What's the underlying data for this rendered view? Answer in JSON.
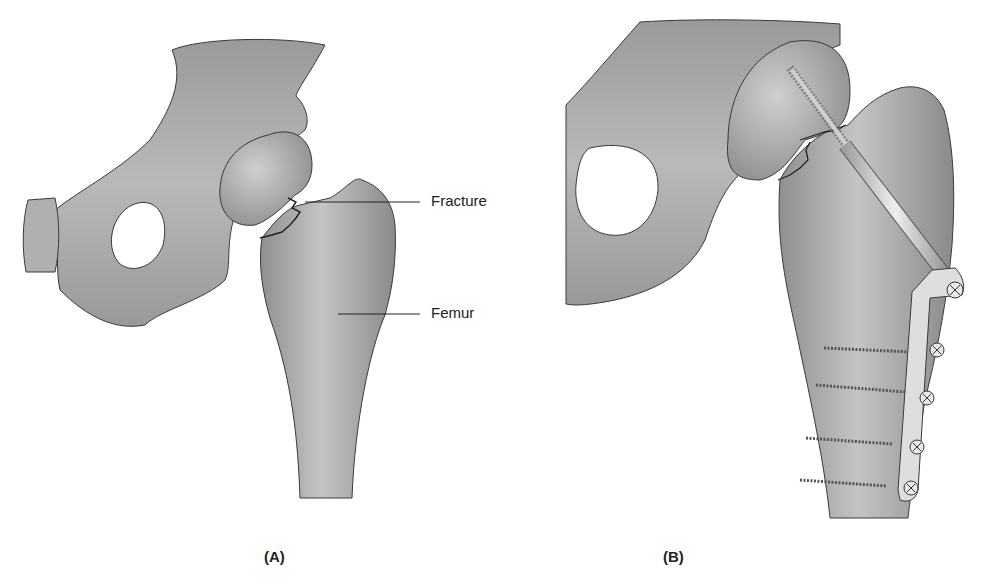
{
  "figure": {
    "panels": [
      {
        "id": "A",
        "label": "(A)",
        "description": "Hip joint with fracture of the femoral neck",
        "callouts": [
          {
            "text": "Fracture"
          },
          {
            "text": "Femur"
          }
        ]
      },
      {
        "id": "B",
        "label": "(B)",
        "description": "Fracture fixed with lag screw and side plate with screws",
        "hardware": {
          "lag_screw": 1,
          "side_plate": 1,
          "plate_screws": 4,
          "plate_screw_heads": 5
        }
      }
    ],
    "colors": {
      "bone_fill": "#a9a9a9",
      "bone_light": "#c8c8c8",
      "bone_dark": "#7a7a7a",
      "outline": "#3a3a3a",
      "metal": "#d8d8d8",
      "text": "#222222"
    }
  }
}
